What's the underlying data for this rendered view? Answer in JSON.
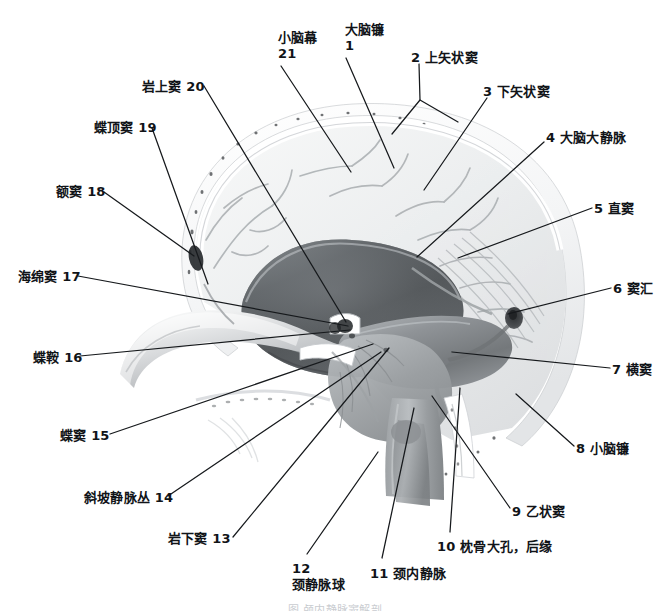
{
  "figure": {
    "caption": "图 颅内静脉窦解剖",
    "width": 670,
    "height": 611,
    "style": "grayscale anatomical illustration, midsagittal section of skull"
  },
  "colors": {
    "background": "#ffffff",
    "label_text": "#111418",
    "leader_line": "#16191c",
    "bone_light": "#f3f4f5",
    "bone_mid": "#d9dbdd",
    "falx_dark": "#4a4d50",
    "falx_mid": "#6e7174",
    "tentorium": "#8c8f92",
    "vessel": "#a8abae",
    "caption_faded": "#c9ccd0"
  },
  "labels": [
    {
      "id": 21,
      "number": "21",
      "name": "小脑幕",
      "display": "小脑幕 21",
      "lines": [
        "小脑幕",
        "21"
      ],
      "layout": "two-line",
      "side": "top",
      "text_x": 278,
      "text_y": 30,
      "leader": [
        [
          281,
          66
        ],
        [
          351,
          172
        ]
      ]
    },
    {
      "id": 1,
      "number": "1",
      "name": "大脑镰",
      "display": "大脑镰 1",
      "lines": [
        "大脑镰",
        "1"
      ],
      "layout": "two-line",
      "side": "top",
      "text_x": 345,
      "text_y": 22,
      "leader": [
        [
          346,
          58
        ],
        [
          394,
          168
        ]
      ]
    },
    {
      "id": 2,
      "number": "2",
      "name": "上矢状窦",
      "display": "2 上矢状窦",
      "layout": "inline-number-first",
      "side": "right",
      "text_x": 411,
      "text_y": 50,
      "leader": [
        [
          419,
          64
        ],
        [
          420,
          100
        ],
        [
          392,
          134
        ]
      ],
      "leader_branch": [
        [
          420,
          100
        ],
        [
          458,
          122
        ]
      ]
    },
    {
      "id": 3,
      "number": "3",
      "name": "下矢状窦",
      "display": "3 下矢状窦",
      "layout": "inline-number-first",
      "side": "right",
      "text_x": 483,
      "text_y": 84,
      "leader": [
        [
          487,
          98
        ],
        [
          424,
          190
        ]
      ]
    },
    {
      "id": 4,
      "number": "4",
      "name": "大脑大静脉",
      "display": "4 大脑大静脉",
      "layout": "inline-number-first",
      "side": "right",
      "text_x": 546,
      "text_y": 130,
      "leader": [
        [
          544,
          142
        ],
        [
          417,
          257
        ]
      ]
    },
    {
      "id": 5,
      "number": "5",
      "name": "直窦",
      "display": "5 直窦",
      "layout": "inline-number-first",
      "side": "right",
      "text_x": 594,
      "text_y": 201,
      "leader": [
        [
          592,
          208
        ],
        [
          458,
          258
        ]
      ]
    },
    {
      "id": 6,
      "number": "6",
      "name": "窦汇",
      "display": "6 窦汇",
      "layout": "inline-number-first",
      "side": "right",
      "text_x": 613,
      "text_y": 281,
      "leader": [
        [
          611,
          288
        ],
        [
          508,
          314
        ]
      ]
    },
    {
      "id": 7,
      "number": "7",
      "name": "横窦",
      "display": "7 横窦",
      "layout": "inline-number-first",
      "side": "right",
      "text_x": 612,
      "text_y": 362,
      "leader": [
        [
          610,
          368
        ],
        [
          452,
          352
        ]
      ]
    },
    {
      "id": 8,
      "number": "8",
      "name": "小脑镰",
      "display": "8 小脑镰",
      "layout": "inline-number-first",
      "side": "right",
      "text_x": 576,
      "text_y": 441,
      "leader": [
        [
          574,
          446
        ],
        [
          516,
          394
        ]
      ]
    },
    {
      "id": 9,
      "number": "9",
      "name": "乙状窦",
      "display": "9 乙状窦",
      "layout": "inline-number-first",
      "side": "right",
      "text_x": 512,
      "text_y": 504,
      "leader": [
        [
          510,
          508
        ],
        [
          432,
          396
        ]
      ]
    },
    {
      "id": 10,
      "number": "10",
      "name": "枕骨大孔，后缘",
      "display": "10 枕骨大孔，后缘",
      "layout": "inline-number-first",
      "side": "bottom",
      "text_x": 437,
      "text_y": 539,
      "leader": [
        [
          450,
          532
        ],
        [
          460,
          388
        ]
      ]
    },
    {
      "id": 11,
      "number": "11",
      "name": "颈内静脉",
      "display": "11 颈内静脉",
      "layout": "inline-number-first",
      "side": "bottom",
      "text_x": 370,
      "text_y": 566,
      "leader": [
        [
          382,
          558
        ],
        [
          414,
          408
        ]
      ]
    },
    {
      "id": 12,
      "number": "12",
      "name": "颈静脉球",
      "display": "12 颈静脉球",
      "lines": [
        "12",
        "颈静脉球"
      ],
      "layout": "two-line",
      "side": "bottom",
      "text_x": 292,
      "text_y": 561,
      "leader": [
        [
          307,
          554
        ],
        [
          378,
          452
        ]
      ]
    },
    {
      "id": 13,
      "number": "13",
      "name": "岩下窦",
      "display": "岩下窦 13",
      "layout": "inline-number-last",
      "side": "left",
      "text_x": 168,
      "text_y": 531,
      "leader": [
        [
          233,
          537
        ],
        [
          389,
          348
        ]
      ]
    },
    {
      "id": 14,
      "number": "14",
      "name": "斜坡静脉丛",
      "display": "斜坡静脉丛 14",
      "layout": "inline-number-last",
      "side": "left",
      "text_x": 84,
      "text_y": 490,
      "leader": [
        [
          168,
          496
        ],
        [
          381,
          352
        ]
      ]
    },
    {
      "id": 15,
      "number": "15",
      "name": "蝶窦",
      "display": "蝶窦 15",
      "layout": "inline-number-last",
      "side": "left",
      "text_x": 60,
      "text_y": 428,
      "leader": [
        [
          110,
          434
        ],
        [
          373,
          344
        ]
      ]
    },
    {
      "id": 16,
      "number": "16",
      "name": "蝶鞍",
      "display": "蝶鞍 16",
      "layout": "inline-number-last",
      "side": "left",
      "text_x": 33,
      "text_y": 350,
      "leader": [
        [
          80,
          356
        ],
        [
          350,
          330
        ]
      ]
    },
    {
      "id": 17,
      "number": "17",
      "name": "海绵窦",
      "display": "海绵窦 17",
      "layout": "inline-number-last",
      "side": "left",
      "text_x": 18,
      "text_y": 269,
      "leader": [
        [
          78,
          276
        ],
        [
          348,
          326
        ]
      ]
    },
    {
      "id": 18,
      "number": "18",
      "name": "额窦",
      "display": "额窦 18",
      "layout": "inline-number-last",
      "side": "left",
      "text_x": 56,
      "text_y": 184,
      "leader": [
        [
          104,
          192
        ],
        [
          194,
          256
        ]
      ]
    },
    {
      "id": 19,
      "number": "19",
      "name": "蝶顶窦",
      "display": "蝶顶窦 19",
      "layout": "inline-number-last",
      "side": "left",
      "text_x": 94,
      "text_y": 120,
      "leader": [
        [
          152,
          128
        ],
        [
          208,
          284
        ]
      ]
    },
    {
      "id": 20,
      "number": "20",
      "name": "岩上窦",
      "display": "岩上窦 20",
      "layout": "inline-number-last",
      "side": "left",
      "text_x": 142,
      "text_y": 79,
      "leader": [
        [
          204,
          86
        ],
        [
          346,
          322
        ]
      ]
    }
  ]
}
